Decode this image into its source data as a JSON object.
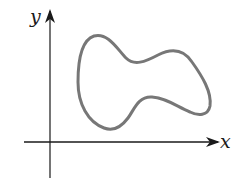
{
  "diagram": {
    "type": "closed-curve-on-axes",
    "axes": {
      "x_label": "x",
      "y_label": "y"
    },
    "colors": {
      "axis": "#1a1a1a",
      "curve": "#777777",
      "background": "#ffffff"
    }
  }
}
